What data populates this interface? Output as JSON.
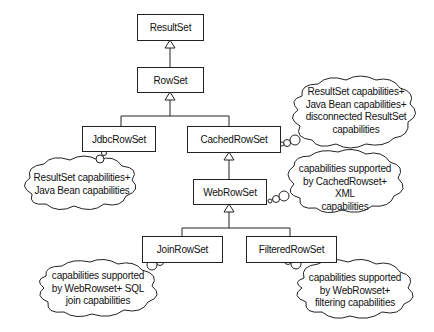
{
  "diagram": {
    "classes": {
      "resultset": "ResultSet",
      "rowset": "RowSet",
      "jdbcrowset": "JdbcRowSet",
      "cachedrowset": "CachedRowSet",
      "webrowset": "WebRowSet",
      "joinrowset": "JoinRowSet",
      "filteredrowset": "FilteredRowSet"
    },
    "notes": {
      "jdbc": [
        "ResultSet capabilities+",
        "Java Bean capabilities"
      ],
      "cached": [
        "ResultSet capabilities+",
        "Java Bean capabilities+",
        "disconnected ResultSet",
        "capabilities"
      ],
      "web": [
        "capabilities supported",
        "by CachedRowset+ XML",
        "capabilities"
      ],
      "join": [
        "capabilities supported",
        "by WebRowset+ SQL",
        "join capabilities"
      ],
      "filtered": [
        "capabilities supported",
        "by WebRowset+",
        "filtering capabilities"
      ]
    },
    "relationships": [
      {
        "from": "RowSet",
        "to": "ResultSet",
        "type": "inheritance"
      },
      {
        "from": "JdbcRowSet",
        "to": "RowSet",
        "type": "inheritance"
      },
      {
        "from": "CachedRowSet",
        "to": "RowSet",
        "type": "inheritance"
      },
      {
        "from": "WebRowSet",
        "to": "CachedRowSet",
        "type": "inheritance"
      },
      {
        "from": "JoinRowSet",
        "to": "WebRowSet",
        "type": "inheritance"
      },
      {
        "from": "FilteredRowSet",
        "to": "WebRowSet",
        "type": "inheritance"
      }
    ]
  }
}
